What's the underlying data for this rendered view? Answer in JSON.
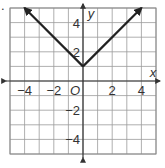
{
  "problem_marker": ".",
  "chart_data": {
    "type": "line",
    "title": "",
    "function": "y = |x| + 1",
    "xlabel": "x",
    "ylabel": "y",
    "origin_label": "O",
    "xlim": [
      -5,
      5
    ],
    "ylim": [
      -5,
      5
    ],
    "grid": true,
    "x_ticks": [
      "-4",
      "-2",
      "2",
      "4"
    ],
    "y_ticks": [
      "4",
      "2",
      "-2",
      "-4"
    ],
    "series": [
      {
        "name": "y = |x| + 1",
        "x": [
          -4,
          0,
          4
        ],
        "y": [
          5,
          1,
          5
        ],
        "arrows": "both"
      }
    ],
    "vertex": [
      0,
      1
    ]
  },
  "style": {
    "grid_color": "#9a9a9a",
    "axis_color": "#333333",
    "line_color": "#222222",
    "border_color": "#8a8a8a"
  }
}
